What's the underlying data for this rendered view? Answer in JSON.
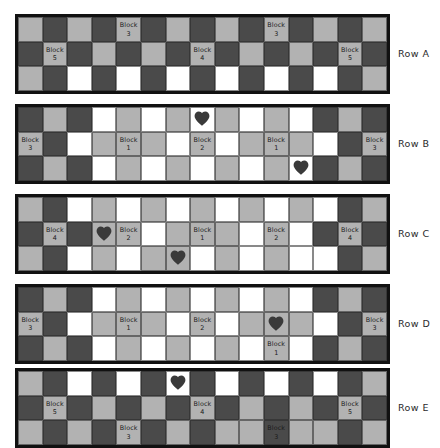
{
  "palette": {
    "light": "#b2b2b2",
    "dark": "#4a4a4a",
    "white": "#ffffff",
    "border": "#111111",
    "text": "#1a1a1a"
  },
  "grid": {
    "columns": 15,
    "sub_rows": 3,
    "cell_px": 24.6
  },
  "legend": {
    "block_prefix": "Block",
    "heart_icon": "heart-icon"
  },
  "rows": [
    {
      "id": "A",
      "label": "Row A",
      "top": 14,
      "cells": [
        [
          "light",
          "dark",
          "light",
          "dark",
          "light",
          "dark",
          "light",
          "dark",
          "light",
          "dark",
          "light",
          "dark",
          "light",
          "dark",
          "light"
        ],
        [
          "dark",
          "light",
          "dark",
          "light",
          "dark",
          "light",
          "dark",
          "light",
          "dark",
          "light",
          "dark",
          "light",
          "dark",
          "light",
          "dark"
        ],
        [
          "light",
          "dark",
          "white",
          "dark",
          "white",
          "dark",
          "white",
          "dark",
          "white",
          "dark",
          "white",
          "dark",
          "white",
          "dark",
          "light"
        ]
      ],
      "blocks": [
        {
          "r": 0,
          "c": 4,
          "label": "Block",
          "value": "3"
        },
        {
          "r": 0,
          "c": 10,
          "label": "Block",
          "value": "3"
        },
        {
          "r": 1,
          "c": 1,
          "label": "Block",
          "value": "5"
        },
        {
          "r": 1,
          "c": 7,
          "label": "Block",
          "value": "4"
        },
        {
          "r": 1,
          "c": 13,
          "label": "Block",
          "value": "5"
        }
      ],
      "hearts": []
    },
    {
      "id": "B",
      "label": "Row B",
      "top": 104,
      "cells": [
        [
          "dark",
          "light",
          "dark",
          "white",
          "light",
          "white",
          "light",
          "white",
          "light",
          "white",
          "light",
          "white",
          "dark",
          "light",
          "dark"
        ],
        [
          "light",
          "dark",
          "white",
          "light",
          "light",
          "light",
          "white",
          "light",
          "white",
          "light",
          "light",
          "light",
          "white",
          "dark",
          "light"
        ],
        [
          "dark",
          "light",
          "dark",
          "white",
          "light",
          "white",
          "light",
          "white",
          "light",
          "white",
          "light",
          "white",
          "dark",
          "light",
          "dark"
        ]
      ],
      "blocks": [
        {
          "r": 1,
          "c": 0,
          "label": "Block",
          "value": "3"
        },
        {
          "r": 1,
          "c": 4,
          "label": "Block",
          "value": "1"
        },
        {
          "r": 1,
          "c": 7,
          "label": "Block",
          "value": "2"
        },
        {
          "r": 1,
          "c": 10,
          "label": "Block",
          "value": "1"
        },
        {
          "r": 1,
          "c": 14,
          "label": "Block",
          "value": "3"
        }
      ],
      "hearts": [
        {
          "r": 0,
          "c": 7
        },
        {
          "r": 2,
          "c": 11
        }
      ]
    },
    {
      "id": "C",
      "label": "Row C",
      "top": 194,
      "cells": [
        [
          "light",
          "dark",
          "white",
          "light",
          "white",
          "light",
          "white",
          "light",
          "white",
          "light",
          "white",
          "light",
          "white",
          "dark",
          "light"
        ],
        [
          "dark",
          "light",
          "dark",
          "light",
          "light",
          "white",
          "light",
          "light",
          "light",
          "white",
          "light",
          "white",
          "dark",
          "light",
          "dark"
        ],
        [
          "light",
          "dark",
          "white",
          "light",
          "white",
          "light",
          "light",
          "white",
          "light",
          "white",
          "light",
          "white",
          "white",
          "dark",
          "light"
        ]
      ],
      "blocks": [
        {
          "r": 1,
          "c": 1,
          "label": "Block",
          "value": "4"
        },
        {
          "r": 1,
          "c": 4,
          "label": "Block",
          "value": "2"
        },
        {
          "r": 1,
          "c": 7,
          "label": "Block",
          "value": "1"
        },
        {
          "r": 1,
          "c": 10,
          "label": "Block",
          "value": "2"
        },
        {
          "r": 1,
          "c": 13,
          "label": "Block",
          "value": "4"
        }
      ],
      "hearts": [
        {
          "r": 1,
          "c": 3
        },
        {
          "r": 2,
          "c": 6
        }
      ]
    },
    {
      "id": "D",
      "label": "Row D",
      "top": 284,
      "cells": [
        [
          "dark",
          "light",
          "dark",
          "white",
          "light",
          "white",
          "light",
          "white",
          "light",
          "white",
          "light",
          "white",
          "dark",
          "light",
          "dark"
        ],
        [
          "light",
          "dark",
          "white",
          "light",
          "light",
          "light",
          "white",
          "light",
          "white",
          "light",
          "light",
          "light",
          "white",
          "dark",
          "light"
        ],
        [
          "dark",
          "light",
          "dark",
          "white",
          "light",
          "white",
          "light",
          "white",
          "light",
          "white",
          "light",
          "white",
          "dark",
          "light",
          "dark"
        ]
      ],
      "blocks": [
        {
          "r": 1,
          "c": 0,
          "label": "Block",
          "value": "3"
        },
        {
          "r": 1,
          "c": 4,
          "label": "Block",
          "value": "1"
        },
        {
          "r": 1,
          "c": 7,
          "label": "Block",
          "value": "2"
        },
        {
          "r": 1,
          "c": 14,
          "label": "Block",
          "value": "3"
        },
        {
          "r": 2,
          "c": 10,
          "label": "Block",
          "value": "1"
        }
      ],
      "hearts": [
        {
          "r": 1,
          "c": 10
        }
      ]
    },
    {
      "id": "E",
      "label": "Row E",
      "top": 368,
      "cells": [
        [
          "light",
          "dark",
          "white",
          "dark",
          "white",
          "dark",
          "white",
          "dark",
          "white",
          "dark",
          "white",
          "dark",
          "white",
          "dark",
          "light"
        ],
        [
          "dark",
          "light",
          "dark",
          "light",
          "dark",
          "light",
          "dark",
          "light",
          "dark",
          "light",
          "dark",
          "light",
          "dark",
          "light",
          "dark"
        ],
        [
          "light",
          "dark",
          "light",
          "dark",
          "light",
          "dark",
          "light",
          "dark",
          "light",
          "light",
          "dark",
          "light",
          "light",
          "dark",
          "light"
        ]
      ],
      "blocks": [
        {
          "r": 1,
          "c": 1,
          "label": "Block",
          "value": "5"
        },
        {
          "r": 1,
          "c": 7,
          "label": "Block",
          "value": "4"
        },
        {
          "r": 1,
          "c": 13,
          "label": "Block",
          "value": "5"
        },
        {
          "r": 2,
          "c": 4,
          "label": "Block",
          "value": "3"
        },
        {
          "r": 2,
          "c": 10,
          "label": "Block",
          "value": "3"
        }
      ],
      "hearts": [
        {
          "r": 0,
          "c": 6
        }
      ]
    }
  ]
}
